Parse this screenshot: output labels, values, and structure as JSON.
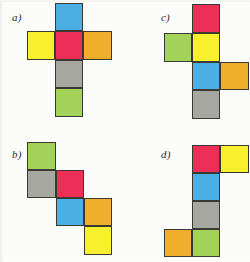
{
  "figure": {
    "width": 250,
    "height": 262,
    "background_color": "#fdfdfb",
    "cell_size": 28,
    "stroke_color": "#3a3a32"
  },
  "palette": {
    "blue": "#4CB0E4",
    "red": "#EE2F58",
    "yellow": "#FAF12E",
    "orange": "#F0B02C",
    "gray": "#A8A8A3",
    "green": "#A5D45A"
  },
  "panels": [
    {
      "id": "a",
      "label": "a)",
      "label_x": 12,
      "label_y": 11,
      "cells": [
        {
          "name": "cell-blue",
          "color_key": "blue",
          "color": "#4CB0E4",
          "x": 55,
          "y": 3,
          "w": 28,
          "h": 28
        },
        {
          "name": "cell-yellow",
          "color_key": "yellow",
          "color": "#FAF12E",
          "x": 27,
          "y": 31,
          "w": 28,
          "h": 29
        },
        {
          "name": "cell-red",
          "color_key": "red",
          "color": "#EE2F58",
          "x": 55,
          "y": 31,
          "w": 28,
          "h": 29
        },
        {
          "name": "cell-orange",
          "color_key": "orange",
          "color": "#F0B02C",
          "x": 83,
          "y": 31,
          "w": 29,
          "h": 29
        },
        {
          "name": "cell-gray",
          "color_key": "gray",
          "color": "#A8A8A3",
          "x": 55,
          "y": 60,
          "w": 28,
          "h": 28
        },
        {
          "name": "cell-green",
          "color_key": "green",
          "color": "#A5D45A",
          "x": 55,
          "y": 88,
          "w": 28,
          "h": 29
        }
      ]
    },
    {
      "id": "c",
      "label": "c)",
      "label_x": 161,
      "label_y": 11,
      "cells": [
        {
          "name": "cell-red",
          "color_key": "red",
          "color": "#EE2F58",
          "x": 192,
          "y": 4,
          "w": 28,
          "h": 29
        },
        {
          "name": "cell-green",
          "color_key": "green",
          "color": "#A5D45A",
          "x": 164,
          "y": 33,
          "w": 28,
          "h": 29
        },
        {
          "name": "cell-yellow",
          "color_key": "yellow",
          "color": "#FAF12E",
          "x": 192,
          "y": 33,
          "w": 28,
          "h": 29
        },
        {
          "name": "cell-blue",
          "color_key": "blue",
          "color": "#4CB0E4",
          "x": 192,
          "y": 62,
          "w": 28,
          "h": 28
        },
        {
          "name": "cell-orange",
          "color_key": "orange",
          "color": "#F0B02C",
          "x": 220,
          "y": 62,
          "w": 29,
          "h": 28
        },
        {
          "name": "cell-gray",
          "color_key": "gray",
          "color": "#A8A8A3",
          "x": 192,
          "y": 90,
          "w": 28,
          "h": 29
        }
      ]
    },
    {
      "id": "b",
      "label": "b)",
      "label_x": 12,
      "label_y": 148,
      "cells": [
        {
          "name": "cell-green",
          "color_key": "green",
          "color": "#A5D45A",
          "x": 27,
          "y": 142,
          "w": 29,
          "h": 28
        },
        {
          "name": "cell-gray",
          "color_key": "gray",
          "color": "#A8A8A3",
          "x": 27,
          "y": 170,
          "w": 29,
          "h": 28
        },
        {
          "name": "cell-red",
          "color_key": "red",
          "color": "#EE2F58",
          "x": 56,
          "y": 170,
          "w": 28,
          "h": 28
        },
        {
          "name": "cell-blue",
          "color_key": "blue",
          "color": "#4CB0E4",
          "x": 56,
          "y": 198,
          "w": 28,
          "h": 28
        },
        {
          "name": "cell-orange",
          "color_key": "orange",
          "color": "#F0B02C",
          "x": 84,
          "y": 198,
          "w": 28,
          "h": 28
        },
        {
          "name": "cell-yellow",
          "color_key": "yellow",
          "color": "#FAF12E",
          "x": 84,
          "y": 226,
          "w": 28,
          "h": 29
        }
      ]
    },
    {
      "id": "d",
      "label": "d)",
      "label_x": 161,
      "label_y": 148,
      "cells": [
        {
          "name": "cell-red",
          "color_key": "red",
          "color": "#EE2F58",
          "x": 192,
          "y": 145,
          "w": 28,
          "h": 28
        },
        {
          "name": "cell-yellow",
          "color_key": "yellow",
          "color": "#FAF12E",
          "x": 220,
          "y": 145,
          "w": 29,
          "h": 28
        },
        {
          "name": "cell-blue",
          "color_key": "blue",
          "color": "#4CB0E4",
          "x": 192,
          "y": 173,
          "w": 28,
          "h": 28
        },
        {
          "name": "cell-gray",
          "color_key": "gray",
          "color": "#A8A8A3",
          "x": 192,
          "y": 201,
          "w": 28,
          "h": 28
        },
        {
          "name": "cell-orange",
          "color_key": "orange",
          "color": "#F0B02C",
          "x": 164,
          "y": 229,
          "w": 28,
          "h": 28
        },
        {
          "name": "cell-green",
          "color_key": "green",
          "color": "#A5D45A",
          "x": 192,
          "y": 229,
          "w": 28,
          "h": 28
        }
      ]
    }
  ]
}
